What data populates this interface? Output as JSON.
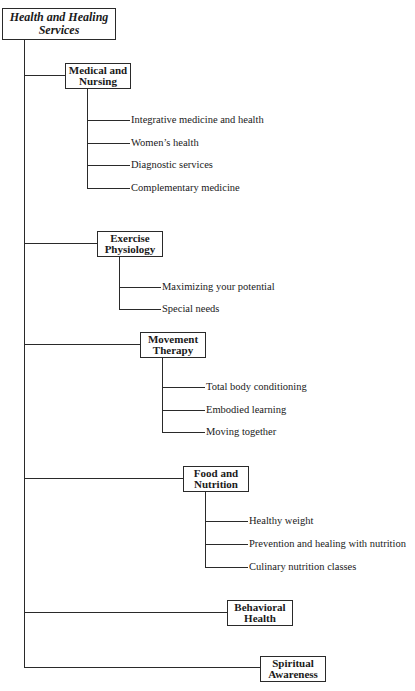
{
  "root": {
    "line1": "Health and Healing",
    "line2": "Services"
  },
  "categories": [
    {
      "line1": "Medical and",
      "line2": "Nursing",
      "items": [
        "Integrative medicine and health",
        "Women’s health",
        "Diagnostic services",
        "Complementary medicine"
      ]
    },
    {
      "line1": "Exercise",
      "line2": "Physiology",
      "items": [
        "Maximizing your potential",
        "Special needs"
      ]
    },
    {
      "line1": "Movement",
      "line2": "Therapy",
      "items": [
        "Total body conditioning",
        "Embodied learning",
        "Moving together"
      ]
    },
    {
      "line1": "Food and",
      "line2": "Nutrition",
      "items": [
        "Healthy weight",
        "Prevention and healing with nutrition",
        "Culinary nutrition classes"
      ]
    },
    {
      "line1": "Behavioral",
      "line2": "Health",
      "items": []
    },
    {
      "line1": "Spiritual",
      "line2": "Awareness",
      "items": []
    }
  ]
}
